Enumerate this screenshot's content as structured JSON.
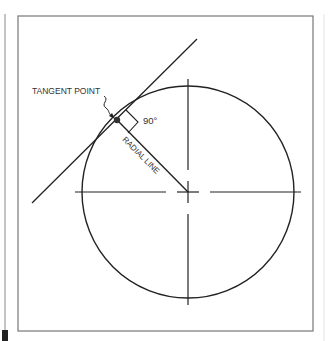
{
  "diagram": {
    "labels": {
      "tangent_point": "TANGENT POINT",
      "radial_line": "RADIAL LINE",
      "angle": "90°"
    },
    "geometry": {
      "circle_center": [
        188,
        192
      ],
      "circle_radius": 106,
      "tangent_point": [
        117,
        120
      ],
      "tangent_line": [
        [
          32,
          203
        ],
        [
          197,
          39
        ]
      ]
    },
    "colors": {
      "line": "#222222",
      "frame": "#777777",
      "background": "#ffffff"
    }
  }
}
